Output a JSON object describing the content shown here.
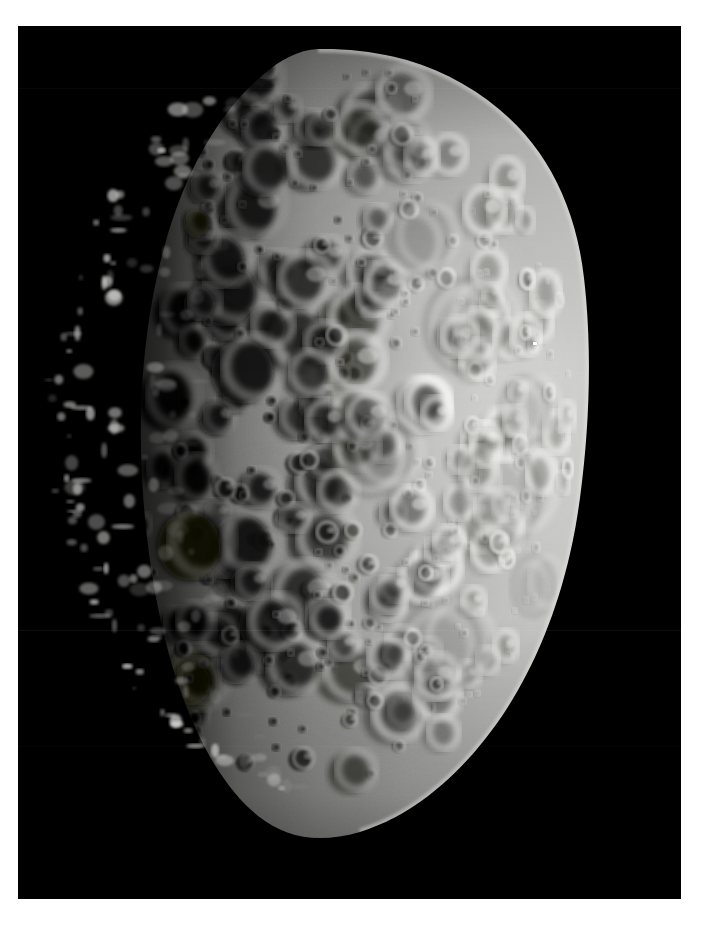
{
  "page": {
    "background_color": "#ffffff",
    "width": 719,
    "height": 928
  },
  "photo": {
    "name": "cratered-moon-photograph",
    "frame": {
      "x": 18,
      "y": 26,
      "width": 663,
      "height": 873
    },
    "space_color": "#000000",
    "subject": "heavily cratered icy moon, gibbous phase",
    "illumination": "sunlit from the right, terminator on the left",
    "body": {
      "center_x": 300,
      "center_y": 395,
      "radius_x": 265,
      "radius_y": 372,
      "limb_highlight_color": "#d8d8d6",
      "midtone_color": "#a8a8a6",
      "shadow_color": "#000000",
      "terminator_x_fraction": 0.3
    },
    "artifacts": {
      "cosmic_ray_dot": {
        "x": 533,
        "y": 342,
        "color": "#ffffff"
      },
      "scanlines_y": [
        630,
        88,
        745
      ]
    }
  },
  "chart_data": {
    "type": "scatter",
    "xlabel": "",
    "ylabel": "",
    "note": "synthetic crater field rendered as image texture"
  }
}
